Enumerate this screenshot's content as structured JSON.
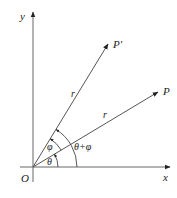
{
  "diagram": {
    "type": "rotation-of-vector",
    "axes": {
      "x_label": "x",
      "y_label": "y",
      "origin_label": "O"
    },
    "points": [
      {
        "label": "P",
        "description": "vector OP at angle theta"
      },
      {
        "label": "P′",
        "description": "vector OP′ at angle theta+phi"
      }
    ],
    "segments": [
      {
        "from": "O",
        "to": "P",
        "length_label": "r"
      },
      {
        "from": "O",
        "to": "P′",
        "length_label": "r"
      }
    ],
    "angles": [
      {
        "label": "θ",
        "between": "x-axis and OP"
      },
      {
        "label": "φ",
        "between": "OP and OP′"
      },
      {
        "label": "θ+φ",
        "between": "x-axis and OP′"
      }
    ],
    "colors": {
      "line": "#555555",
      "text": "#222222"
    }
  }
}
